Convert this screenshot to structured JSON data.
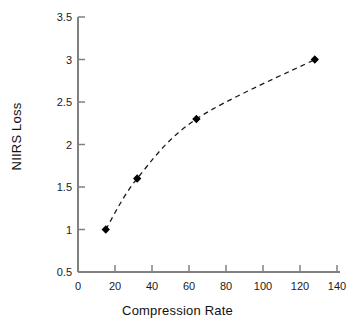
{
  "chart_data": {
    "type": "scatter",
    "title": "",
    "xlabel": "Compression Rate",
    "ylabel": "NIIRS Loss",
    "xlim": [
      0,
      140
    ],
    "ylim": [
      0.5,
      3.5
    ],
    "xticks": [
      0,
      20,
      40,
      60,
      80,
      100,
      120,
      140
    ],
    "yticks": [
      0.5,
      1,
      1.5,
      2,
      2.5,
      3,
      3.5
    ],
    "xtick_labels": [
      "0",
      "20",
      "40",
      "60",
      "80",
      "100",
      "120",
      "140"
    ],
    "ytick_labels": [
      "0.5",
      "1",
      "1.5",
      "2",
      "2.5",
      "3",
      "3.5"
    ],
    "grid": false,
    "legend": false,
    "legend_position": "none",
    "series": [
      {
        "name": "NIIRS Loss",
        "marker": "filled-diamond",
        "marker_color": "#000000",
        "line_style": "dashed",
        "line_color": "#1a1a1a",
        "x": [
          15,
          32,
          64,
          128
        ],
        "y": [
          1.0,
          1.6,
          2.3,
          3.0
        ],
        "points": [
          {
            "x": 15,
            "y": 1.0
          },
          {
            "x": 32,
            "y": 1.6
          },
          {
            "x": 64,
            "y": 2.3
          },
          {
            "x": 128,
            "y": 3.0
          }
        ]
      }
    ],
    "axis_color": "#808080",
    "background_color": "#ffffff"
  }
}
